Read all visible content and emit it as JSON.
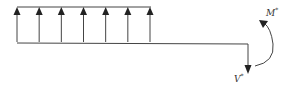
{
  "diagram": {
    "type": "free-body diagram",
    "distributed_load": {
      "direction": "up",
      "arrow_count": 7
    },
    "labels": {
      "shear": {
        "base": "V",
        "sup": "*"
      },
      "moment": {
        "base": "M",
        "sup": "*"
      }
    },
    "colors": {
      "line": "#333333",
      "background": "#ffffff"
    }
  }
}
